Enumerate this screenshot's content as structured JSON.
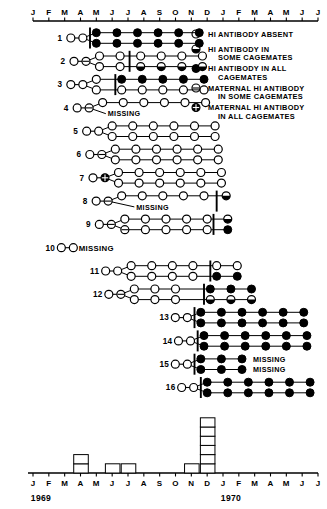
{
  "figure": {
    "type": "timeline-pedigree",
    "axis": {
      "month_ticks": [
        "J",
        "F",
        "M",
        "A",
        "M",
        "J",
        "J",
        "A",
        "S",
        "O",
        "N",
        "D",
        "J",
        "F",
        "M",
        "A",
        "M",
        "J",
        "J"
      ],
      "year_labels": [
        "1969",
        "1970"
      ],
      "year_label_positions": [
        0,
        12
      ]
    },
    "legend": [
      {
        "symbol": "open-circle",
        "lines": [
          "HI ANTIBODY ABSENT"
        ]
      },
      {
        "symbol": "half-filled-circle",
        "lines": [
          "HI ANTIBODY IN",
          "SOME CAGEMATES"
        ]
      },
      {
        "symbol": "filled-circle",
        "lines": [
          "HI ANTIBODY IN ALL",
          "CAGEMATES"
        ]
      },
      {
        "symbol": "maternal-open-circle",
        "lines": [
          "MATERNAL HI ANTIBODY",
          "IN SOME CAGEMATES"
        ]
      },
      {
        "symbol": "maternal-filled-circle",
        "lines": [
          "MATERNAL HI ANTIBODY",
          "IN ALL CAGEMATES"
        ]
      }
    ],
    "missing_label": "MISSING",
    "rows": [
      {
        "id": "1",
        "pre": [
          "open",
          "open"
        ],
        "bar_at": 3.6,
        "upper": [
          {
            "x": 4.0,
            "s": "filled"
          },
          {
            "x": 5.3,
            "s": "filled"
          },
          {
            "x": 6.6,
            "s": "filled"
          },
          {
            "x": 7.9,
            "s": "filled"
          },
          {
            "x": 9.2,
            "s": "filled"
          },
          {
            "x": 10.5,
            "s": "filled"
          }
        ],
        "lower": [
          {
            "x": 4.0,
            "s": "filled"
          },
          {
            "x": 5.3,
            "s": "filled"
          },
          {
            "x": 6.6,
            "s": "filled"
          },
          {
            "x": 7.9,
            "s": "filled"
          },
          {
            "x": 9.2,
            "s": "filled"
          },
          {
            "x": 10.5,
            "s": "filled"
          }
        ],
        "missing": null
      },
      {
        "id": "2",
        "pre": [
          "open",
          "maternal-open"
        ],
        "bar_at": 6.1,
        "upper": [
          {
            "x": 4.2,
            "s": "open"
          },
          {
            "x": 5.5,
            "s": "open"
          },
          {
            "x": 6.8,
            "s": "open"
          },
          {
            "x": 8.1,
            "s": "open"
          },
          {
            "x": 9.4,
            "s": "open"
          },
          {
            "x": 10.7,
            "s": "open"
          }
        ],
        "lower": [
          {
            "x": 4.2,
            "s": "open"
          },
          {
            "x": 5.5,
            "s": "open"
          },
          {
            "x": 6.8,
            "s": "half"
          },
          {
            "x": 8.1,
            "s": "half"
          },
          {
            "x": 9.4,
            "s": "half"
          },
          {
            "x": 10.7,
            "s": "half"
          }
        ],
        "missing": null
      },
      {
        "id": "3",
        "pre": [
          "open",
          "open"
        ],
        "bar_at": 5.2,
        "upper": [
          {
            "x": 4.0,
            "s": "open"
          },
          {
            "x": 5.6,
            "s": "filled"
          },
          {
            "x": 6.9,
            "s": "filled"
          },
          {
            "x": 8.2,
            "s": "filled"
          },
          {
            "x": 9.5,
            "s": "filled"
          },
          {
            "x": 10.8,
            "s": "filled"
          }
        ],
        "lower": [
          {
            "x": 4.0,
            "s": "open"
          },
          {
            "x": 5.6,
            "s": "open"
          },
          {
            "x": 6.9,
            "s": "open"
          },
          {
            "x": 8.2,
            "s": "open"
          },
          {
            "x": 9.5,
            "s": "open"
          },
          {
            "x": 10.8,
            "s": "open"
          }
        ],
        "missing": null
      },
      {
        "id": "4",
        "pre": [
          "open",
          "maternal-open"
        ],
        "bar_at": null,
        "upper": [
          {
            "x": 4.4,
            "s": "open"
          },
          {
            "x": 5.7,
            "s": "open"
          },
          {
            "x": 7.0,
            "s": "open"
          },
          {
            "x": 8.3,
            "s": "open"
          },
          {
            "x": 9.6,
            "s": "open"
          },
          {
            "x": 10.9,
            "s": "open"
          }
        ],
        "lower": [],
        "missing": {
          "x": 4.6,
          "row": "lower"
        }
      },
      {
        "id": "5",
        "pre": [
          "open",
          "open"
        ],
        "bar_at": null,
        "upper": [
          {
            "x": 5.0,
            "s": "open"
          },
          {
            "x": 6.3,
            "s": "open"
          },
          {
            "x": 7.6,
            "s": "open"
          },
          {
            "x": 8.9,
            "s": "open"
          },
          {
            "x": 10.2,
            "s": "open"
          },
          {
            "x": 11.5,
            "s": "open"
          }
        ],
        "lower": [
          {
            "x": 5.0,
            "s": "open"
          },
          {
            "x": 6.3,
            "s": "open"
          },
          {
            "x": 7.6,
            "s": "open"
          },
          {
            "x": 8.9,
            "s": "open"
          },
          {
            "x": 10.2,
            "s": "open"
          },
          {
            "x": 11.5,
            "s": "open"
          }
        ],
        "missing": null
      },
      {
        "id": "6",
        "pre": [
          "open",
          "maternal-open"
        ],
        "bar_at": null,
        "upper": [
          {
            "x": 5.2,
            "s": "open"
          },
          {
            "x": 6.5,
            "s": "open"
          },
          {
            "x": 7.8,
            "s": "open"
          },
          {
            "x": 9.1,
            "s": "open"
          },
          {
            "x": 10.4,
            "s": "open"
          },
          {
            "x": 11.7,
            "s": "open"
          }
        ],
        "lower": [
          {
            "x": 5.2,
            "s": "open"
          },
          {
            "x": 6.5,
            "s": "open"
          },
          {
            "x": 7.8,
            "s": "open"
          },
          {
            "x": 9.1,
            "s": "open"
          },
          {
            "x": 10.4,
            "s": "open"
          },
          {
            "x": 11.7,
            "s": "open"
          }
        ],
        "missing": null
      },
      {
        "id": "7",
        "pre": [
          "open",
          "maternal-filled"
        ],
        "bar_at": null,
        "upper": [
          {
            "x": 5.4,
            "s": "open"
          },
          {
            "x": 6.7,
            "s": "open"
          },
          {
            "x": 8.0,
            "s": "open"
          },
          {
            "x": 9.3,
            "s": "open"
          },
          {
            "x": 10.6,
            "s": "open"
          },
          {
            "x": 11.9,
            "s": "open"
          }
        ],
        "lower": [
          {
            "x": 5.4,
            "s": "open"
          },
          {
            "x": 6.7,
            "s": "open"
          },
          {
            "x": 8.0,
            "s": "open"
          },
          {
            "x": 9.3,
            "s": "open"
          },
          {
            "x": 10.6,
            "s": "open"
          },
          {
            "x": 11.9,
            "s": "open"
          }
        ],
        "missing": null
      },
      {
        "id": "8",
        "pre": [
          "open",
          "maternal-open"
        ],
        "bar_at": 11.6,
        "upper": [
          {
            "x": 5.6,
            "s": "open"
          },
          {
            "x": 6.9,
            "s": "open"
          },
          {
            "x": 8.2,
            "s": "open"
          },
          {
            "x": 9.5,
            "s": "open"
          },
          {
            "x": 10.8,
            "s": "open"
          },
          {
            "x": 12.2,
            "s": "half"
          }
        ],
        "lower": [],
        "missing": {
          "x": 6.4,
          "row": "lower"
        }
      },
      {
        "id": "9",
        "pre": [
          "open",
          "maternal-open"
        ],
        "bar_at": 11.4,
        "upper": [
          {
            "x": 5.8,
            "s": "open"
          },
          {
            "x": 7.1,
            "s": "open"
          },
          {
            "x": 8.4,
            "s": "open"
          },
          {
            "x": 9.7,
            "s": "open"
          },
          {
            "x": 11.0,
            "s": "open"
          },
          {
            "x": 12.3,
            "s": "half"
          }
        ],
        "lower": [
          {
            "x": 5.8,
            "s": "maternal-open"
          },
          {
            "x": 7.1,
            "s": "open"
          },
          {
            "x": 8.4,
            "s": "open"
          },
          {
            "x": 9.7,
            "s": "open"
          },
          {
            "x": 11.0,
            "s": "open"
          },
          {
            "x": 12.3,
            "s": "filled"
          }
        ],
        "missing": null
      },
      {
        "id": "10",
        "pre": [
          "open",
          "open"
        ],
        "bar_at": null,
        "upper": [],
        "lower": [],
        "missing": {
          "x": 3.4,
          "row": "upper"
        }
      },
      {
        "id": "11",
        "pre": [
          "open",
          "open"
        ],
        "bar_at": 11.2,
        "upper": [
          {
            "x": 6.2,
            "s": "open"
          },
          {
            "x": 7.5,
            "s": "open"
          },
          {
            "x": 8.8,
            "s": "open"
          },
          {
            "x": 10.1,
            "s": "open"
          },
          {
            "x": 11.6,
            "s": "open"
          },
          {
            "x": 12.9,
            "s": "open"
          }
        ],
        "lower": [
          {
            "x": 6.2,
            "s": "open"
          },
          {
            "x": 7.5,
            "s": "open"
          },
          {
            "x": 8.8,
            "s": "open"
          },
          {
            "x": 10.1,
            "s": "open"
          },
          {
            "x": 11.6,
            "s": "filled"
          },
          {
            "x": 12.9,
            "s": "filled"
          }
        ],
        "missing": null
      },
      {
        "id": "12",
        "pre": [
          "open",
          "maternal-open"
        ],
        "bar_at": 10.8,
        "upper": [
          {
            "x": 6.4,
            "s": "open"
          },
          {
            "x": 7.7,
            "s": "open"
          },
          {
            "x": 9.0,
            "s": "open"
          },
          {
            "x": 11.2,
            "s": "filled"
          },
          {
            "x": 12.5,
            "s": "filled"
          },
          {
            "x": 13.8,
            "s": "filled"
          }
        ],
        "lower": [
          {
            "x": 6.4,
            "s": "open"
          },
          {
            "x": 7.7,
            "s": "open"
          },
          {
            "x": 9.0,
            "s": "open"
          },
          {
            "x": 11.2,
            "s": "half"
          },
          {
            "x": 12.5,
            "s": "half"
          },
          {
            "x": 13.8,
            "s": "half"
          }
        ],
        "missing": null
      },
      {
        "id": "13",
        "pre": [
          "open",
          "open"
        ],
        "bar_at": 10.2,
        "upper": [
          {
            "x": 10.6,
            "s": "filled"
          },
          {
            "x": 11.9,
            "s": "filled"
          },
          {
            "x": 13.2,
            "s": "filled"
          },
          {
            "x": 14.5,
            "s": "filled"
          },
          {
            "x": 15.8,
            "s": "filled"
          },
          {
            "x": 17.1,
            "s": "filled"
          }
        ],
        "lower": [
          {
            "x": 10.6,
            "s": "filled"
          },
          {
            "x": 11.9,
            "s": "filled"
          },
          {
            "x": 13.2,
            "s": "filled"
          },
          {
            "x": 14.5,
            "s": "filled"
          },
          {
            "x": 15.8,
            "s": "filled"
          },
          {
            "x": 17.1,
            "s": "filled"
          }
        ],
        "missing": null
      },
      {
        "id": "14",
        "pre": [
          "open",
          "open"
        ],
        "bar_at": 10.4,
        "upper": [
          {
            "x": 10.8,
            "s": "filled"
          },
          {
            "x": 12.1,
            "s": "filled"
          },
          {
            "x": 13.4,
            "s": "filled"
          },
          {
            "x": 14.7,
            "s": "filled"
          },
          {
            "x": 16.0,
            "s": "filled"
          },
          {
            "x": 17.3,
            "s": "filled"
          }
        ],
        "lower": [
          {
            "x": 10.8,
            "s": "filled"
          },
          {
            "x": 12.1,
            "s": "filled"
          },
          {
            "x": 13.4,
            "s": "filled"
          },
          {
            "x": 14.7,
            "s": "filled"
          },
          {
            "x": 16.0,
            "s": "filled"
          },
          {
            "x": 17.3,
            "s": "filled"
          }
        ],
        "missing": null
      },
      {
        "id": "15",
        "pre": [
          "open",
          "open"
        ],
        "bar_at": 10.2,
        "upper": [
          {
            "x": 10.6,
            "s": "filled"
          },
          {
            "x": 11.9,
            "s": "filled"
          },
          {
            "x": 13.2,
            "s": "filled"
          }
        ],
        "lower": [
          {
            "x": 10.6,
            "s": "filled"
          },
          {
            "x": 11.9,
            "s": "filled"
          },
          {
            "x": 13.2,
            "s": "filled"
          }
        ],
        "missing_upper_text": {
          "x": 13.9,
          "text": "MISSING"
        },
        "missing_lower_text": {
          "x": 13.9,
          "text": "MISSING"
        },
        "missing": null
      },
      {
        "id": "16",
        "pre": [
          "open",
          "open"
        ],
        "bar_at": 10.6,
        "upper": [
          {
            "x": 11.0,
            "s": "filled"
          },
          {
            "x": 12.3,
            "s": "filled"
          },
          {
            "x": 13.6,
            "s": "filled"
          },
          {
            "x": 14.9,
            "s": "filled"
          },
          {
            "x": 16.2,
            "s": "filled"
          },
          {
            "x": 17.5,
            "s": "filled"
          }
        ],
        "lower": [
          {
            "x": 11.0,
            "s": "filled"
          },
          {
            "x": 12.3,
            "s": "filled"
          },
          {
            "x": 13.6,
            "s": "filled"
          },
          {
            "x": 14.9,
            "s": "filled"
          },
          {
            "x": 16.2,
            "s": "filled"
          },
          {
            "x": 17.5,
            "s": "filled"
          }
        ],
        "missing": null
      }
    ]
  },
  "chart_data": {
    "type": "bar",
    "title": "",
    "xlabel": "",
    "ylabel": "",
    "categories": [
      "J",
      "F",
      "M",
      "A",
      "M",
      "J",
      "J",
      "A",
      "S",
      "O",
      "N",
      "D",
      "J",
      "F",
      "M",
      "A",
      "M",
      "J",
      "J"
    ],
    "year_labels": [
      "1969",
      "1970"
    ],
    "values": [
      0,
      0,
      0,
      2,
      0,
      1,
      1,
      0,
      0,
      0,
      1,
      6,
      0,
      0,
      0,
      0,
      0,
      0,
      0
    ],
    "stacked_detail": [
      {
        "month": "A",
        "year": "1969",
        "count": 2
      },
      {
        "month": "J",
        "year": "1969",
        "count": 1
      },
      {
        "month": "J2",
        "year": "1969",
        "count": 1
      },
      {
        "month": "N",
        "year": "1969",
        "count": 1
      },
      {
        "month": "D-a",
        "year": "1969",
        "count": 4
      },
      {
        "month": "D-b",
        "year": "1969",
        "count": 6
      },
      {
        "month": "D-c",
        "year": "1969",
        "count": 4
      }
    ],
    "ylim": [
      0,
      6
    ],
    "grid": false,
    "legend_position": "none"
  }
}
